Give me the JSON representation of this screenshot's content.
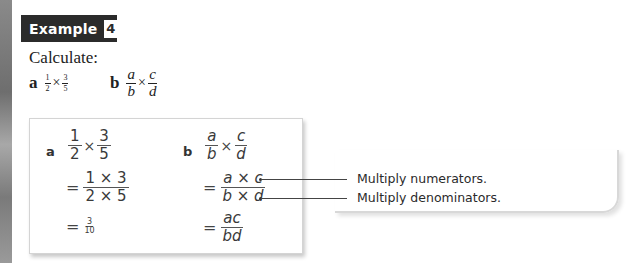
{
  "example": {
    "label": "Example",
    "number": "4"
  },
  "instruction": "Calculate:",
  "questions": [
    {
      "letter": "a",
      "left": {
        "num": "1",
        "den": "2"
      },
      "op": "×",
      "right": {
        "num": "3",
        "den": "5"
      }
    },
    {
      "letter": "b",
      "left": {
        "num": "a",
        "den": "b"
      },
      "op": "×",
      "right": {
        "num": "c",
        "den": "d"
      }
    }
  ],
  "solution": {
    "a": {
      "label": "a",
      "line1": {
        "left": {
          "num": "1",
          "den": "2"
        },
        "op": "×",
        "right": {
          "num": "3",
          "den": "5"
        }
      },
      "line2": {
        "eq": "=",
        "num": "1 × 3",
        "den": "2 × 5"
      },
      "line3": {
        "eq": "=",
        "num": "3",
        "den": "10"
      }
    },
    "b": {
      "label": "b",
      "line1": {
        "left": {
          "num": "a",
          "den": "b"
        },
        "op": "×",
        "right": {
          "num": "c",
          "den": "d"
        }
      },
      "line2": {
        "eq": "=",
        "num": "a × c",
        "den": "b × d"
      },
      "line3": {
        "eq": "=",
        "num": "ac",
        "den": "bd"
      }
    }
  },
  "callouts": [
    {
      "text": "Multiply numerators."
    },
    {
      "text": "Multiply denominators."
    }
  ],
  "colors": {
    "header_bg": "#2b2b2b",
    "header_text": "#ffffff",
    "card_border": "#d4d4d4"
  }
}
